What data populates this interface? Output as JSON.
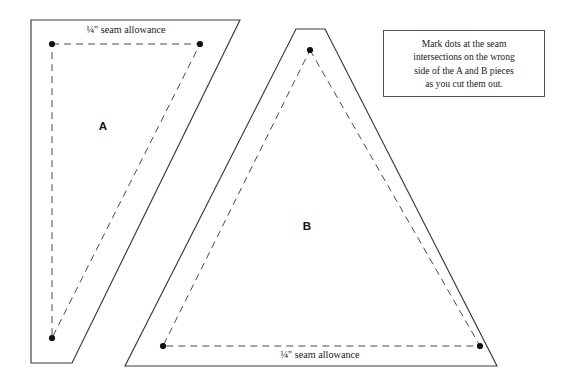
{
  "canvas": {
    "width": 573,
    "height": 390,
    "background": "#ffffff"
  },
  "colors": {
    "outline_stroke": "#3a3a3a",
    "seamline_stroke": "#4a4a4a",
    "dot_fill": "#111111",
    "text": "#1a1a1a",
    "note_border": "#555555"
  },
  "pieces": [
    {
      "id": "A",
      "label": "A",
      "label_pos": {
        "x": 103,
        "y": 127
      },
      "outline_points": "31,20 240,20 72,363 31,363",
      "seamline_points": "52,44 200,44 52,338",
      "dots": [
        {
          "x": 52,
          "y": 44
        },
        {
          "x": 200,
          "y": 44
        },
        {
          "x": 52,
          "y": 338
        }
      ],
      "seam_allowance_label": "¼\" seam allowance",
      "seam_label_pos": {
        "x": 126,
        "y": 31
      }
    },
    {
      "id": "B",
      "label": "B",
      "label_pos": {
        "x": 307,
        "y": 227
      },
      "outline_points": "296,29 325,29 497,366 125,366",
      "seamline_points": "310,50 480,346 163,346",
      "dots": [
        {
          "x": 310,
          "y": 50
        },
        {
          "x": 480,
          "y": 346
        },
        {
          "x": 163,
          "y": 346
        }
      ],
      "seam_allowance_label": "¼\" seam allowance",
      "seam_label_pos": {
        "x": 320,
        "y": 356
      }
    }
  ],
  "note": {
    "lines": [
      "Mark dots at the seam",
      "intersections on the wrong",
      "side of the A and B pieces",
      "as you cut them out."
    ],
    "full_text": "Mark dots at the seam intersections on the wrong side of the A and B pieces as you cut them out."
  }
}
